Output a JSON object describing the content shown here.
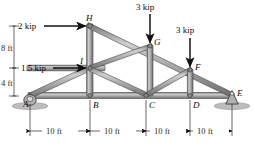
{
  "figure": {
    "type": "truss-free-body-diagram",
    "colors": {
      "member_fill": "#9a9a9a",
      "member_edge": "#4a4a4a",
      "member_highlight": "#c9c9c9",
      "ground": "#b9b9b9",
      "arrow": "#1a1a1a",
      "text": "#0d0d0d"
    }
  },
  "joints": [
    {
      "id": "A",
      "label": "A",
      "x": 30,
      "y": 96
    },
    {
      "id": "B",
      "label": "B",
      "x": 90,
      "y": 96
    },
    {
      "id": "C",
      "label": "C",
      "x": 146,
      "y": 96
    },
    {
      "id": "D",
      "label": "D",
      "x": 190,
      "y": 96
    },
    {
      "id": "E",
      "label": "E",
      "x": 232,
      "y": 96
    },
    {
      "id": "F",
      "label": "F",
      "x": 190,
      "y": 70
    },
    {
      "id": "G",
      "label": "G",
      "x": 150,
      "y": 46
    },
    {
      "id": "H",
      "label": "H",
      "x": 90,
      "y": 26
    },
    {
      "id": "I",
      "label": "I",
      "x": 90,
      "y": 68
    }
  ],
  "loads": [
    {
      "id": "load-H",
      "label": "2 kip",
      "magnitude": 2,
      "unit": "kip",
      "direction": "right",
      "applied_at": "H"
    },
    {
      "id": "load-I",
      "label": "1.5 kip",
      "magnitude": 1.5,
      "unit": "kip",
      "direction": "right",
      "applied_at": "I"
    },
    {
      "id": "load-G",
      "label": "3 kip",
      "magnitude": 3,
      "unit": "kip",
      "direction": "down",
      "applied_at": "G"
    },
    {
      "id": "load-F",
      "label": "3 kip",
      "magnitude": 3,
      "unit": "kip",
      "direction": "down",
      "applied_at": "F"
    }
  ],
  "vertical_dimensions": [
    {
      "id": "dim-8ft",
      "label": "8 ft",
      "value": 8,
      "unit": "ft",
      "from": "I-level",
      "to": "H-level"
    },
    {
      "id": "dim-4ft",
      "label": "4 ft",
      "value": 4,
      "unit": "ft",
      "from": "A-level",
      "to": "I-level"
    }
  ],
  "horizontal_dimensions": [
    {
      "id": "dim-AB",
      "label": "10 ft",
      "value": 10,
      "unit": "ft"
    },
    {
      "id": "dim-BC",
      "label": "10 ft",
      "value": 10,
      "unit": "ft"
    },
    {
      "id": "dim-CD",
      "label": "10 ft",
      "value": 10,
      "unit": "ft"
    },
    {
      "id": "dim-DE",
      "label": "10 ft",
      "value": 10,
      "unit": "ft"
    }
  ],
  "supports": [
    {
      "id": "support-A",
      "type": "rocker",
      "at": "A"
    },
    {
      "id": "support-E",
      "type": "pin",
      "at": "E"
    }
  ]
}
